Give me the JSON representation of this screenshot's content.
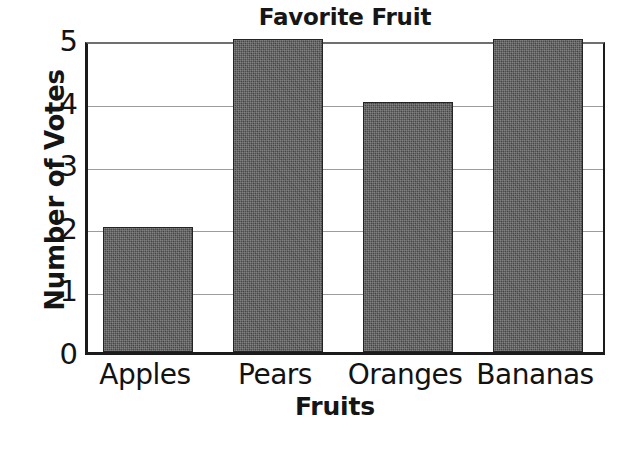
{
  "chart_data": {
    "type": "bar",
    "title": "Favorite Fruit",
    "xlabel": "Fruits",
    "ylabel": "Number of Votes",
    "categories": [
      "Apples",
      "Pears",
      "Oranges",
      "Bananas"
    ],
    "values": [
      2,
      5,
      4,
      5
    ],
    "ylim": [
      0,
      5
    ],
    "ytick_labels": [
      "0",
      "1",
      "2",
      "3",
      "4",
      "5"
    ],
    "ytick_values": [
      0,
      1,
      2,
      3,
      4,
      5
    ],
    "grid": true,
    "legend": "none",
    "bar_color": "#4e4e4e",
    "bar_edge_color": "#242424",
    "gridline_color": "#9c9c9c",
    "axis_color": "#1b1b1b",
    "background_color": "#ffffff",
    "text_color": "#131313"
  }
}
